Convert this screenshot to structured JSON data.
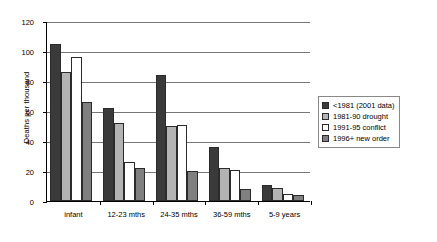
{
  "chart_data": {
    "type": "bar",
    "title": "",
    "xlabel": "",
    "ylabel": "Deaths per thousand",
    "ylim": [
      0,
      120
    ],
    "yticks": [
      0,
      20,
      40,
      60,
      80,
      100,
      120
    ],
    "grid": true,
    "legend_position": "right",
    "categories": [
      "infant",
      "12-23 mths",
      "24-35 mths",
      "36-59 mths",
      "5-9 years"
    ],
    "series": [
      {
        "name": "<1981 (2001 data)",
        "color": "#3a3a3a",
        "values": [
          105,
          62,
          84,
          36,
          11
        ]
      },
      {
        "name": "1981-90 drought",
        "color": "#b3b3b3",
        "values": [
          86,
          52,
          50,
          22,
          9
        ]
      },
      {
        "name": "1991-95 conflict",
        "color": "#ffffff",
        "values": [
          96,
          26,
          51,
          21,
          5
        ]
      },
      {
        "name": "1996+ new order",
        "color": "#808080",
        "values": [
          66,
          22,
          20,
          8,
          4
        ]
      }
    ]
  },
  "axis": {
    "y_title": "Deaths per thousand",
    "y_tick_labels": [
      "0",
      "20",
      "40",
      "60",
      "80",
      "100",
      "120"
    ]
  },
  "legend": {
    "items": [
      {
        "label": "<1981 (2001 data)",
        "color": "#3a3a3a"
      },
      {
        "label": "1981-90 drought",
        "color": "#b3b3b3"
      },
      {
        "label": "1991-95 conflict",
        "color": "#ffffff"
      },
      {
        "label": "1996+ new order",
        "color": "#808080"
      }
    ]
  }
}
